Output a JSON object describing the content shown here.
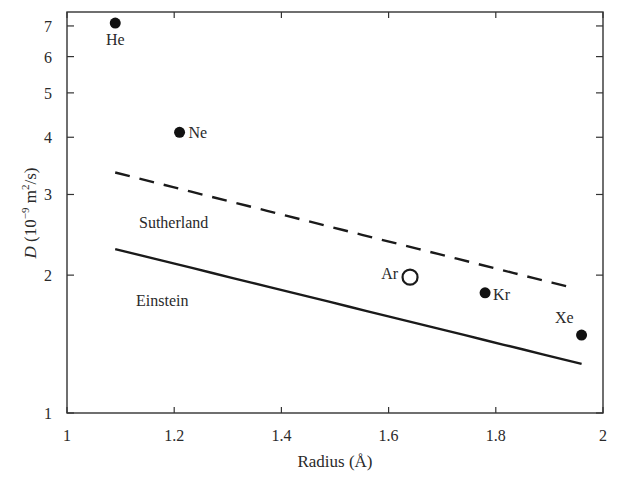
{
  "chart_data": {
    "type": "scatter",
    "title": "",
    "xlabel": "Radius (Å)",
    "ylabel": "D (10⁻⁹ m²/s)",
    "ylabel_parts": {
      "italic": "D",
      "rest_pre": " (10",
      "exp1": "−9",
      "mid": " m",
      "exp2": "2",
      "post": "/s)"
    },
    "xlim": [
      1,
      2
    ],
    "ylim": [
      1,
      7.5
    ],
    "yscale": "log",
    "grid": false,
    "x_ticks": [
      "1",
      "1.2",
      "1.4",
      "1.6",
      "1.8",
      "2"
    ],
    "x_tick_values": [
      1,
      1.2,
      1.4,
      1.6,
      1.8,
      2
    ],
    "y_ticks": [
      "1",
      "2",
      "3",
      "4",
      "5",
      "6",
      "7"
    ],
    "y_tick_values": [
      1,
      2,
      3,
      4,
      5,
      6,
      7
    ],
    "points": [
      {
        "label": "He",
        "x": 1.09,
        "y": 7.1,
        "marker": "filled"
      },
      {
        "label": "Ne",
        "x": 1.21,
        "y": 4.1,
        "marker": "filled"
      },
      {
        "label": "Ar",
        "x": 1.64,
        "y": 1.98,
        "marker": "open"
      },
      {
        "label": "Kr",
        "x": 1.78,
        "y": 1.83,
        "marker": "filled"
      },
      {
        "label": "Xe",
        "x": 1.96,
        "y": 1.48,
        "marker": "filled"
      }
    ],
    "series": [
      {
        "name": "Sutherland",
        "style": "dashed",
        "x": [
          1.09,
          1.94
        ],
        "y": [
          3.35,
          1.88
        ]
      },
      {
        "name": "Einstein",
        "style": "solid",
        "x": [
          1.09,
          1.96
        ],
        "y": [
          2.28,
          1.28
        ]
      }
    ],
    "annotations": [
      "Sutherland",
      "Einstein"
    ]
  }
}
